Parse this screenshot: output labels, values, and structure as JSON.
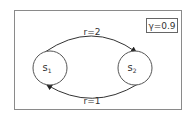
{
  "diagram": {
    "type": "markov-decision-process",
    "discount": "γ=0.9",
    "states": [
      {
        "id": "s1",
        "label": "s",
        "subscript": "1"
      },
      {
        "id": "s2",
        "label": "s",
        "subscript": "2"
      }
    ],
    "transitions": [
      {
        "from": "s1",
        "to": "s2",
        "label": "r=2"
      },
      {
        "from": "s2",
        "to": "s1",
        "label": "r=1"
      }
    ]
  }
}
